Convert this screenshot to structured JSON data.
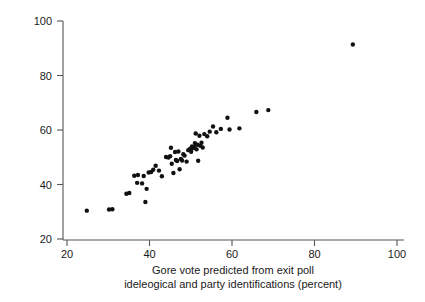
{
  "chart_data": {
    "type": "scatter",
    "title": "",
    "xlabel_line1": "Gore vote predicted from exit poll",
    "xlabel_line2": "ideleogical and party identifications (percent)",
    "ylabel": "Actual Gore vote (percent)",
    "xlim": [
      18,
      104
    ],
    "ylim": [
      18,
      103
    ],
    "xticks": [
      20,
      40,
      60,
      80,
      100
    ],
    "yticks": [
      20,
      40,
      60,
      80,
      100
    ],
    "xtick_labels": [
      "20",
      "40",
      "60",
      "80",
      "100"
    ],
    "ytick_labels": [
      "20",
      "40",
      "60",
      "80",
      "100"
    ],
    "grid": false,
    "legend": "none",
    "marker": "filled-circle",
    "marker_color": "#111111",
    "marker_size_px": 4.2,
    "points": [
      {
        "x": 24.8,
        "y": 30.4
      },
      {
        "x": 30.2,
        "y": 30.8
      },
      {
        "x": 31.0,
        "y": 30.9
      },
      {
        "x": 34.4,
        "y": 36.6
      },
      {
        "x": 35.1,
        "y": 36.9
      },
      {
        "x": 36.3,
        "y": 43.2
      },
      {
        "x": 37.0,
        "y": 40.6
      },
      {
        "x": 37.2,
        "y": 43.5
      },
      {
        "x": 38.2,
        "y": 40.4
      },
      {
        "x": 38.6,
        "y": 43.1
      },
      {
        "x": 39.0,
        "y": 33.6
      },
      {
        "x": 39.3,
        "y": 38.4
      },
      {
        "x": 39.8,
        "y": 44.4
      },
      {
        "x": 40.4,
        "y": 44.6
      },
      {
        "x": 40.9,
        "y": 45.4
      },
      {
        "x": 41.5,
        "y": 46.9
      },
      {
        "x": 42.3,
        "y": 45.1
      },
      {
        "x": 43.0,
        "y": 43.0
      },
      {
        "x": 44.0,
        "y": 50.1
      },
      {
        "x": 44.6,
        "y": 49.9
      },
      {
        "x": 45.0,
        "y": 50.4
      },
      {
        "x": 45.2,
        "y": 53.5
      },
      {
        "x": 45.4,
        "y": 47.6
      },
      {
        "x": 45.8,
        "y": 44.2
      },
      {
        "x": 46.2,
        "y": 51.9
      },
      {
        "x": 46.4,
        "y": 49.0
      },
      {
        "x": 46.7,
        "y": 48.6
      },
      {
        "x": 47.0,
        "y": 52.1
      },
      {
        "x": 47.3,
        "y": 45.6
      },
      {
        "x": 47.6,
        "y": 49.4
      },
      {
        "x": 47.9,
        "y": 48.8
      },
      {
        "x": 48.2,
        "y": 51.1
      },
      {
        "x": 48.5,
        "y": 50.6
      },
      {
        "x": 49.0,
        "y": 48.4
      },
      {
        "x": 49.4,
        "y": 52.6
      },
      {
        "x": 49.8,
        "y": 53.0
      },
      {
        "x": 50.1,
        "y": 52.0
      },
      {
        "x": 50.3,
        "y": 54.0
      },
      {
        "x": 50.6,
        "y": 53.4
      },
      {
        "x": 50.9,
        "y": 53.8
      },
      {
        "x": 51.0,
        "y": 55.2
      },
      {
        "x": 51.2,
        "y": 58.7
      },
      {
        "x": 51.4,
        "y": 52.9
      },
      {
        "x": 51.6,
        "y": 54.6
      },
      {
        "x": 51.8,
        "y": 48.7
      },
      {
        "x": 52.1,
        "y": 57.9
      },
      {
        "x": 52.3,
        "y": 54.2
      },
      {
        "x": 52.6,
        "y": 55.3
      },
      {
        "x": 52.9,
        "y": 53.6
      },
      {
        "x": 53.3,
        "y": 58.5
      },
      {
        "x": 54.0,
        "y": 57.7
      },
      {
        "x": 54.6,
        "y": 59.4
      },
      {
        "x": 55.4,
        "y": 61.3
      },
      {
        "x": 56.2,
        "y": 59.2
      },
      {
        "x": 57.3,
        "y": 60.4
      },
      {
        "x": 58.9,
        "y": 64.5
      },
      {
        "x": 59.4,
        "y": 60.2
      },
      {
        "x": 61.8,
        "y": 60.6
      },
      {
        "x": 65.9,
        "y": 66.6
      },
      {
        "x": 68.8,
        "y": 67.3
      },
      {
        "x": 89.3,
        "y": 91.4
      }
    ]
  }
}
